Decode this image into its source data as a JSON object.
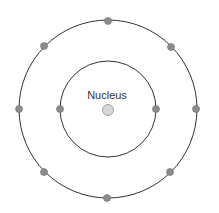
{
  "diagram": {
    "type": "bohr-atom-model",
    "nucleus": {
      "label": "Nucleus",
      "fill": "#d8d8d8",
      "stroke": "#8a8a8a"
    },
    "shells": [
      {
        "name": "inner-shell",
        "electron_count": 2
      },
      {
        "name": "outer-shell",
        "electron_count": 8
      }
    ],
    "colors": {
      "orbit": "#333333",
      "electron": "#8c8c8c",
      "electron_stroke": "#6e6e6e"
    }
  }
}
